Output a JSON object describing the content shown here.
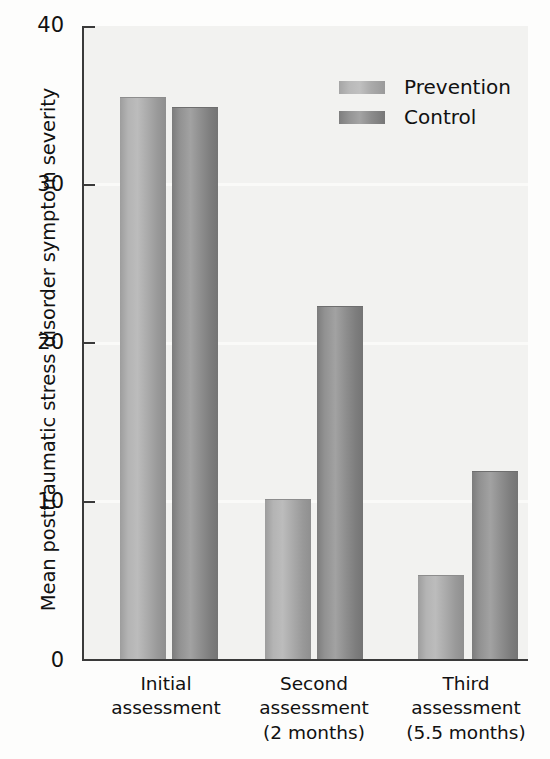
{
  "chart_data": {
    "type": "bar",
    "title": "",
    "xlabel": "",
    "ylabel": "Mean posttraumatic stress disorder symptom severity",
    "ylim": [
      0,
      40
    ],
    "yticks": [
      0,
      10,
      20,
      30,
      40
    ],
    "ytick_labels": [
      "0",
      "10",
      "20",
      "30",
      "40"
    ],
    "grid": false,
    "legend_position": "upper right",
    "categories": [
      "Initial\nassessment",
      "Second\nassessment\n(2 months)",
      "Third\nassessment\n(5.5 months)"
    ],
    "series": [
      {
        "name": "Prevention",
        "color": "#b4b4b4",
        "values": [
          35.5,
          10.1,
          5.3
        ]
      },
      {
        "name": "Control",
        "color": "#8d8d8d",
        "values": [
          34.9,
          22.3,
          11.9
        ]
      }
    ]
  },
  "legend": {
    "items": [
      {
        "label": "Prevention"
      },
      {
        "label": "Control"
      }
    ]
  },
  "axes": {
    "y_title": "Mean posttraumatic stress disorder symptom severity",
    "tick_40": "40",
    "tick_30": "30",
    "tick_20": "20",
    "tick_10": "10",
    "tick_0": "0"
  },
  "x_categories": {
    "group1": "Initial\nassessment",
    "group2": "Second\nassessment\n(2 months)",
    "group3": "Third\nassessment\n(5.5 months)"
  },
  "colors": {
    "prevention": "#b4b4b4",
    "control": "#8d8d8d",
    "axis": "#3a3a3a",
    "plot_background": "#f2f2f0"
  }
}
